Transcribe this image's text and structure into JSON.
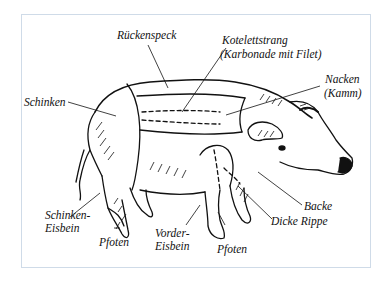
{
  "diagram": {
    "frame_color": "#cfdbe8",
    "line_color": "#111111",
    "labels": {
      "rueckenspeck": "Rückenspeck",
      "kotelett_1": "Kotelettstrang",
      "kotelett_2": "(Karbonade mit Filet)",
      "nacken_1": "Nacken",
      "nacken_2": "(Kamm)",
      "schinken": "Schinken",
      "schinken_eisbein_1": "Schinken-",
      "schinken_eisbein_2": "Eisbein",
      "pfoten_hind": "Pfoten",
      "vorder_eisbein_1": "Vorder-",
      "vorder_eisbein_2": "Eisbein",
      "pfoten_front": "Pfoten",
      "backe": "Backe",
      "dicke_rippe": "Dicke Rippe"
    }
  }
}
